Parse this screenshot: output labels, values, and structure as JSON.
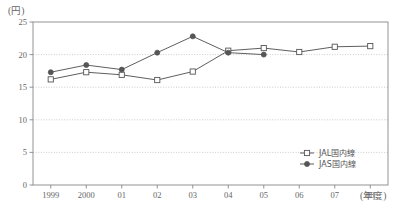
{
  "chart_data": {
    "type": "line",
    "title": "",
    "xlabel": "(年度)",
    "ylabel": "(円)",
    "ylim": [
      0,
      25
    ],
    "yticks": [
      "0",
      "5",
      "10",
      "15",
      "20",
      "25"
    ],
    "ytick_values": [
      0,
      5,
      10,
      15,
      20,
      25
    ],
    "grid": true,
    "legend_position": "lower right",
    "categories": [
      "1999",
      "2000",
      "01",
      "02",
      "03",
      "04",
      "05",
      "06",
      "07",
      "08"
    ],
    "series": [
      {
        "name": "JAL国内線",
        "marker": "open-square",
        "color": "#555555",
        "values": [
          16.2,
          17.3,
          16.9,
          16.1,
          17.4,
          20.6,
          21.0,
          20.4,
          21.2,
          21.3
        ]
      },
      {
        "name": "JAS国内線",
        "marker": "filled-circle",
        "color": "#555555",
        "values": [
          17.3,
          18.4,
          17.7,
          20.3,
          22.8,
          20.3,
          20.0,
          null,
          null,
          null
        ]
      }
    ]
  },
  "axes": {
    "y_unit": "(円)",
    "x_unit": "(年度)"
  },
  "legend": {
    "items": [
      {
        "label": "JAL国内線"
      },
      {
        "label": "JAS国内線"
      }
    ]
  },
  "colors": {
    "line": "#555555",
    "grid": "#aaaaaa",
    "frame": "#888888",
    "text": "#666666",
    "background": "#ffffff"
  }
}
